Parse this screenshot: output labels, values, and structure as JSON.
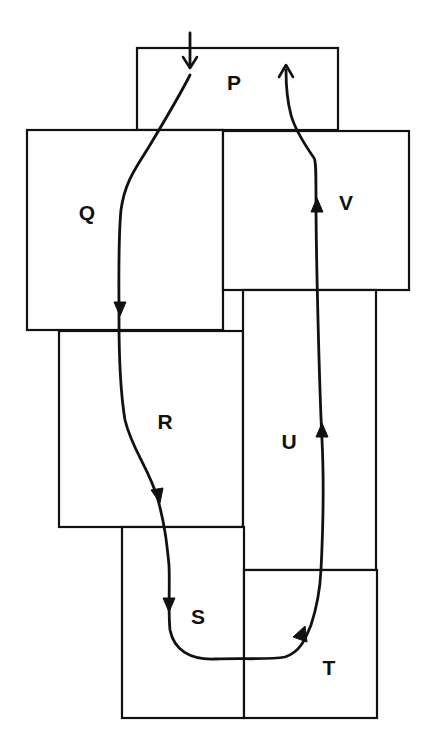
{
  "diagram": {
    "type": "room-route-map",
    "rooms": [
      {
        "id": "P",
        "label": "P",
        "x": 137,
        "y": 48,
        "w": 201,
        "h": 82,
        "label_x": 234,
        "label_y": 83
      },
      {
        "id": "Q",
        "label": "Q",
        "x": 27,
        "y": 130,
        "w": 196,
        "h": 200,
        "label_x": 87,
        "label_y": 213
      },
      {
        "id": "V",
        "label": "V",
        "x": 223,
        "y": 131,
        "w": 186,
        "h": 159,
        "label_x": 346,
        "label_y": 203
      },
      {
        "id": "R",
        "label": "R",
        "x": 59,
        "y": 331,
        "w": 184,
        "h": 196,
        "label_x": 165,
        "label_y": 422
      },
      {
        "id": "U",
        "label": "U",
        "x": 243,
        "y": 290,
        "w": 133,
        "h": 280,
        "label_x": 289,
        "label_y": 442
      },
      {
        "id": "S",
        "label": "S",
        "x": 122,
        "y": 527,
        "w": 122,
        "h": 191,
        "label_x": 198,
        "label_y": 617
      },
      {
        "id": "T",
        "label": "T",
        "x": 244,
        "y": 570,
        "w": 133,
        "h": 148,
        "label_x": 329,
        "label_y": 668
      }
    ],
    "route": {
      "sequence": [
        "P",
        "Q",
        "R",
        "S",
        "T",
        "U",
        "V",
        "P"
      ],
      "entry_arrow": {
        "from": [
          190,
          33
        ],
        "to": [
          190,
          70
        ],
        "direction": "down"
      },
      "exit_arrow": {
        "at": [
          286,
          64
        ],
        "direction": "up"
      },
      "direction_markers": [
        {
          "room": "Q",
          "x": 120,
          "y": 310,
          "direction": "down"
        },
        {
          "room": "R",
          "x": 158,
          "y": 497,
          "direction": "down"
        },
        {
          "room": "S",
          "x": 169,
          "y": 605,
          "direction": "down"
        },
        {
          "room": "T",
          "x": 300,
          "y": 633,
          "direction": "right-up"
        },
        {
          "room": "U",
          "x": 321,
          "y": 432,
          "direction": "up"
        },
        {
          "room": "V",
          "x": 317,
          "y": 205,
          "direction": "up"
        }
      ]
    },
    "colors": {
      "line": "#111111",
      "background": "#ffffff"
    }
  }
}
